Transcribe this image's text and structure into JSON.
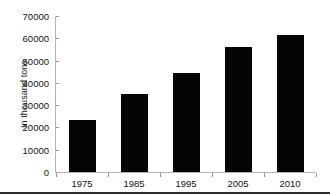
{
  "chart_data": {
    "type": "bar",
    "title": "",
    "subtitle": "",
    "xlabel": "",
    "ylabel": "In thousand tons",
    "categories": [
      "1975",
      "1985",
      "1995",
      "2005",
      "2010"
    ],
    "values": [
      23500,
      35000,
      44500,
      56000,
      61500
    ],
    "ylim": [
      0,
      70000
    ],
    "ytick_labels": [
      "0",
      "10000",
      "20000",
      "30000",
      "40000",
      "50000",
      "60000",
      "70000"
    ],
    "ytick_values": [
      0,
      10000,
      20000,
      30000,
      40000,
      50000,
      60000,
      70000
    ],
    "grid": false,
    "legend": false,
    "legend_position": "none",
    "colors": {
      "bar": "#050505",
      "axis": "#b4b4b4",
      "tick": "#9a9a9a",
      "text": "#141414",
      "background": "#ffffff",
      "frame_bottom": "#2b2b2b"
    }
  }
}
